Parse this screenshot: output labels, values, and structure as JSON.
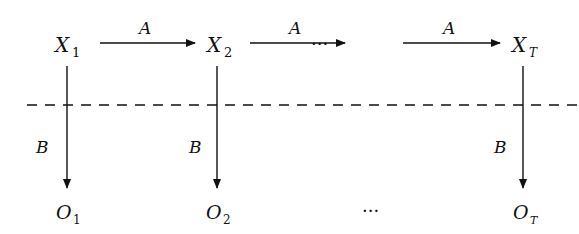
{
  "diagram": {
    "hidden_states": [
      {
        "name": "X",
        "sub": "1"
      },
      {
        "name": "X",
        "sub": "2"
      },
      {
        "name": "X",
        "sub": "T"
      }
    ],
    "observations": [
      {
        "name": "O",
        "sub": "1"
      },
      {
        "name": "O",
        "sub": "2"
      },
      {
        "name": "O",
        "sub": "T"
      }
    ],
    "transition_label": "A",
    "emission_label": "B",
    "ellipsis": "···",
    "colors": {
      "line": "#111111",
      "background": "#ffffff"
    }
  }
}
